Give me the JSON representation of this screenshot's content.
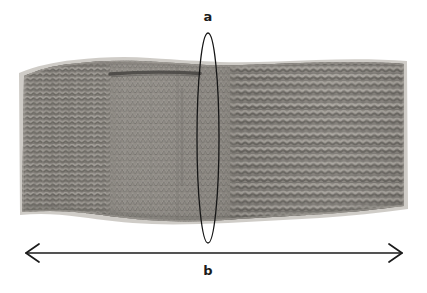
{
  "figure": {
    "type": "annotated-photograph",
    "background_color": "#ffffff",
    "annotation_color": "#1b1b1b",
    "labels": {
      "a": "a",
      "b": "b"
    },
    "annotations": [
      {
        "name": "ellipse-marker-a",
        "shape": "ellipse",
        "label": "a",
        "cx": 208,
        "cy": 138,
        "rx": 11,
        "ry": 105,
        "stroke": "#161616",
        "stroke_width": 1.3,
        "fill": "none",
        "meaning": "vertical-dimension-marker"
      },
      {
        "name": "double-arrow-b",
        "shape": "double-headed-arrow",
        "label": "b",
        "x1": 24,
        "x2": 404,
        "y": 253,
        "stroke": "#1b1b1b",
        "stroke_width": 1.6,
        "arrowhead_style": "open-chevron",
        "meaning": "horizontal-width-dimension"
      }
    ],
    "fabric": {
      "name": "knitted-swatch",
      "left": 22,
      "right": 405,
      "top": 62,
      "bottom": 220,
      "yarn_color_light": "#b9b5ae",
      "yarn_color_mid": "#8e8a84",
      "yarn_color_dark": "#55534f",
      "shadow_color": "#d9d6d1",
      "regions": [
        {
          "name": "left-garter-section",
          "x_start": 22,
          "x_end": 112,
          "stitch_pattern": "garter-ridges-vertical-columns"
        },
        {
          "name": "middle-stockinette-section",
          "x_start": 112,
          "x_end": 230,
          "stitch_pattern": "fine-stockinette"
        },
        {
          "name": "right-garter-section",
          "x_start": 230,
          "x_end": 405,
          "stitch_pattern": "coarse-garter-ridges-horizontal"
        }
      ],
      "features": [
        {
          "name": "buttonhole-slit",
          "x_start": 110,
          "x_end": 200,
          "y": 73,
          "color": "#1d1c1b"
        },
        {
          "name": "vertical-seam-line",
          "x": 182,
          "y_start": 88,
          "y_end": 185,
          "color": "#6d6a66"
        }
      ]
    }
  }
}
